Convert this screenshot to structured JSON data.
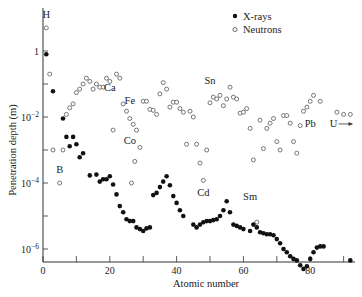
{
  "chart_data": {
    "type": "scatter",
    "title": "",
    "xlabel": "Atomic number",
    "ylabel": "Penetration depth (m)",
    "xlim": [
      0,
      92
    ],
    "ylim": [
      1e-07,
      30
    ],
    "yscale": "log",
    "grid": false,
    "legend_position": "top-right",
    "x_ticks": [
      0,
      20,
      40,
      60,
      80
    ],
    "x_minor_ticks": [
      10,
      30,
      50,
      70,
      90
    ],
    "y_ticks": [
      {
        "value": 1,
        "label": "1"
      },
      {
        "value": 0.01,
        "label": "10^-2"
      },
      {
        "value": 0.0001,
        "label": "10^-4"
      },
      {
        "value": 1e-06,
        "label": "10^-6"
      }
    ],
    "y_minor_ticks": [
      0.1,
      0.001,
      1e-05
    ],
    "colors": {
      "xrays": "#111111",
      "neutrons": "#555555",
      "axis": "#333333"
    },
    "series": [
      {
        "name": "X-rays",
        "marker": "filled-circle",
        "points": [
          [
            1,
            0.8
          ],
          [
            3,
            0.06
          ],
          [
            6,
            0.009
          ],
          [
            7,
            0.0025
          ],
          [
            8,
            0.0013
          ],
          [
            9,
            0.0025
          ],
          [
            10,
            0.0015
          ],
          [
            11,
            0.0006
          ],
          [
            12,
            0.0008
          ],
          [
            14,
            0.00017
          ],
          [
            16,
            0.00018
          ],
          [
            17,
            0.00011
          ],
          [
            18,
            0.00013
          ],
          [
            19,
            0.00013
          ],
          [
            20,
            0.00016
          ],
          [
            21,
            9e-05
          ],
          [
            22,
            4.5e-05
          ],
          [
            23,
            2e-05
          ],
          [
            24,
            1.3e-05
          ],
          [
            25,
            8e-06
          ],
          [
            26,
            7e-06
          ],
          [
            27,
            7e-06
          ],
          [
            28,
            4.5e-06
          ],
          [
            29,
            4e-06
          ],
          [
            30,
            3.5e-06
          ],
          [
            31,
            4.2e-06
          ],
          [
            32,
            4.5e-06
          ],
          [
            33,
            4.3e-05
          ],
          [
            34,
            5e-05
          ],
          [
            35,
            7.5e-05
          ],
          [
            36,
            0.00011
          ],
          [
            37,
            0.00016
          ],
          [
            38,
            8.5e-05
          ],
          [
            39,
            4e-05
          ],
          [
            40,
            2.5e-05
          ],
          [
            41,
            1.5e-05
          ],
          [
            42,
            1e-05
          ],
          [
            45,
            5.5e-06
          ],
          [
            46,
            4.5e-06
          ],
          [
            47,
            5.5e-06
          ],
          [
            48,
            6.5e-06
          ],
          [
            49,
            7e-06
          ],
          [
            50,
            7e-06
          ],
          [
            51,
            7.5e-06
          ],
          [
            52,
            8e-06
          ],
          [
            53,
            1e-05
          ],
          [
            54,
            1.5e-05
          ],
          [
            55,
            2.8e-05
          ],
          [
            56,
            1.3e-05
          ],
          [
            57,
            5.5e-06
          ],
          [
            58,
            5e-06
          ],
          [
            59,
            4.5e-06
          ],
          [
            60,
            4e-06
          ],
          [
            62,
            3.5e-06
          ],
          [
            63,
            5.5e-06
          ],
          [
            64,
            4.5e-06
          ],
          [
            65,
            3.2e-06
          ],
          [
            66,
            3e-06
          ],
          [
            67,
            2.8e-06
          ],
          [
            68,
            2.8e-06
          ],
          [
            69,
            2.6e-06
          ],
          [
            70,
            2e-06
          ],
          [
            71,
            1.5e-06
          ],
          [
            72,
            1e-06
          ],
          [
            73,
            8e-07
          ],
          [
            74,
            6e-07
          ],
          [
            75,
            5e-07
          ],
          [
            76,
            4.5e-07
          ],
          [
            77,
            3.2e-07
          ],
          [
            78,
            2.5e-07
          ],
          [
            79,
            3e-07
          ],
          [
            80,
            5e-07
          ],
          [
            81,
            8e-07
          ],
          [
            82,
            1.1e-06
          ],
          [
            83,
            1.2e-06
          ],
          [
            84,
            1.2e-06
          ],
          [
            92,
            4.5e-07
          ]
        ]
      },
      {
        "name": "Neutrons",
        "marker": "open-circle",
        "points": [
          [
            1,
            5
          ],
          [
            2,
            0.2
          ],
          [
            3,
            0.001
          ],
          [
            5,
            0.0001
          ],
          [
            6,
            0.001
          ],
          [
            7,
            0.012
          ],
          [
            8,
            0.019
          ],
          [
            9,
            0.025
          ],
          [
            10,
            0.055
          ],
          [
            11,
            0.07
          ],
          [
            12,
            0.1
          ],
          [
            13,
            0.15
          ],
          [
            14,
            0.12
          ],
          [
            15,
            0.07
          ],
          [
            16,
            0.1
          ],
          [
            17,
            0.08
          ],
          [
            18,
            0.08
          ],
          [
            19,
            0.15
          ],
          [
            20,
            0.12
          ],
          [
            21,
            0.004
          ],
          [
            22,
            0.2
          ],
          [
            23,
            0.15
          ],
          [
            24,
            0.025
          ],
          [
            25,
            0.015
          ],
          [
            26,
            0.009
          ],
          [
            27,
            0.006
          ],
          [
            28,
            0.004
          ],
          [
            29,
            0.0012
          ],
          [
            27.5,
            0.00045
          ],
          [
            26.5,
            0.0001
          ],
          [
            30,
            0.03
          ],
          [
            31,
            0.03
          ],
          [
            32,
            0.017
          ],
          [
            33,
            0.016
          ],
          [
            34,
            0.012
          ],
          [
            35,
            0.05
          ],
          [
            36,
            0.11
          ],
          [
            37,
            0.07
          ],
          [
            38,
            0.02
          ],
          [
            39,
            0.028
          ],
          [
            40,
            0.028
          ],
          [
            41,
            0.018
          ],
          [
            42,
            0.014
          ],
          [
            43,
            0.0015
          ],
          [
            44,
            0.015
          ],
          [
            45,
            0.01
          ],
          [
            46,
            0.0015
          ],
          [
            47,
            0.0004
          ],
          [
            48,
            0.00012
          ],
          [
            49,
            0.001
          ],
          [
            50,
            0.027
          ],
          [
            51,
            0.04
          ],
          [
            52,
            0.035
          ],
          [
            53,
            0.045
          ],
          [
            54,
            0.022
          ],
          [
            55,
            0.035
          ],
          [
            56,
            0.08
          ],
          [
            57,
            0.04
          ],
          [
            58,
            0.035
          ],
          [
            59,
            0.013
          ],
          [
            60,
            0.014
          ],
          [
            61,
            0.018
          ],
          [
            62,
            0.0045
          ],
          [
            63,
            0.0005
          ],
          [
            64,
            6.5e-06
          ],
          [
            65,
            0.008
          ],
          [
            66,
            0.0011
          ],
          [
            67,
            0.0045
          ],
          [
            68,
            0.0065
          ],
          [
            69,
            0.009
          ],
          [
            70,
            0.0018
          ],
          [
            71,
            0.001
          ],
          [
            72,
            0.011
          ],
          [
            73,
            0.011
          ],
          [
            74,
            0.0065
          ],
          [
            75,
            0.0018
          ],
          [
            76,
            0.0008
          ],
          [
            77,
            0.0055
          ],
          [
            78,
            0.015
          ],
          [
            79,
            0.02
          ],
          [
            80,
            0.03
          ],
          [
            81,
            0.045
          ],
          [
            83,
            0.03
          ],
          [
            88,
            0.014
          ],
          [
            90,
            0.012
          ],
          [
            92,
            0.012
          ]
        ]
      }
    ],
    "annotations": [
      {
        "text": "H",
        "x": 1,
        "y": 10
      },
      {
        "text": "Ca",
        "x": 20,
        "y": 0.06
      },
      {
        "text": "Fe",
        "x": 26,
        "y": 0.025
      },
      {
        "text": "Co",
        "x": 26,
        "y": 0.0015
      },
      {
        "text": "B",
        "x": 5,
        "y": 0.0002
      },
      {
        "text": "Sn",
        "x": 50,
        "y": 0.1
      },
      {
        "text": "Cd",
        "x": 48,
        "y": 4e-05
      },
      {
        "text": "Sm",
        "x": 62,
        "y": 3e-05
      },
      {
        "text": "Pb",
        "x": 80,
        "y": 0.005
      },
      {
        "text": "U",
        "x": 87,
        "y": 0.005
      }
    ]
  },
  "legend": {
    "xrays_label": "X-rays",
    "neutrons_label": "Neutrons"
  },
  "axes": {
    "xlabel": "Atomic number",
    "ylabel": "Penetration depth (m)"
  }
}
